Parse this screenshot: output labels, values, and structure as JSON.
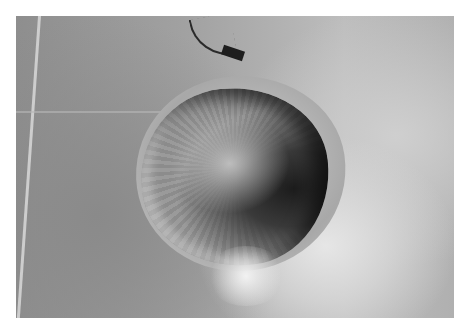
{
  "image": {
    "type": "aerial-photograph",
    "color_mode": "grayscale",
    "subject": "impact crater",
    "colors": {
      "border": "#ffffff",
      "terrain_dark": "#8e8e8e",
      "terrain_light": "#d8d8d8",
      "crater_shadow": "#1c1c1c"
    }
  }
}
